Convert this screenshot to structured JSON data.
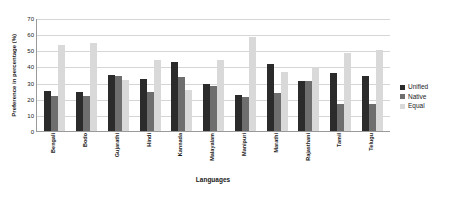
{
  "chart_data": {
    "type": "bar",
    "title": "",
    "xlabel": "Languages",
    "ylabel": "Preference in percentage (%)",
    "ylim": [
      0,
      70
    ],
    "yticks": [
      0,
      10,
      20,
      30,
      40,
      50,
      60,
      70
    ],
    "grid": true,
    "legend_position": "right",
    "categories": [
      "Bengali",
      "Bodo",
      "Gujarathi",
      "Hindi",
      "Kannada",
      "Malayalam",
      "Manipuri",
      "Marathi",
      "Rajasthani",
      "Tamil",
      "Telugu"
    ],
    "series": [
      {
        "name": "Unified",
        "color": "#2b2b2b",
        "values": [
          25,
          24,
          35,
          32.5,
          42.5,
          29,
          22.5,
          41.5,
          31,
          36,
          34
        ]
      },
      {
        "name": "Native",
        "color": "#6e6e6e",
        "values": [
          21.5,
          22,
          34,
          24,
          33.5,
          28,
          21,
          23.5,
          31,
          17,
          17
        ]
      },
      {
        "name": "Equal",
        "color": "#d9d9d9",
        "values": [
          53.5,
          54.5,
          31.5,
          44,
          25.5,
          44,
          58,
          36.5,
          39.5,
          48.5,
          50
        ]
      }
    ]
  },
  "legend": {
    "items": [
      {
        "label": "Unified"
      },
      {
        "label": "Native"
      },
      {
        "label": "Equal"
      }
    ]
  }
}
